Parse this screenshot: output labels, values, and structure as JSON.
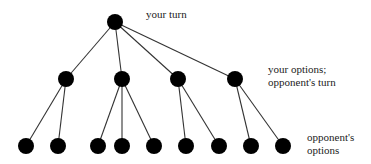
{
  "diagram": {
    "type": "game-tree",
    "colors": {
      "node": "#000000",
      "edge": "#333333",
      "text": "#222222",
      "background": "#ffffff"
    },
    "node_radius": 8,
    "nodes": [
      {
        "id": "root",
        "level": 0,
        "x": 115,
        "y": 22
      },
      {
        "id": "m1",
        "level": 1,
        "x": 66,
        "y": 79
      },
      {
        "id": "m2",
        "level": 1,
        "x": 122,
        "y": 79
      },
      {
        "id": "m3",
        "level": 1,
        "x": 178,
        "y": 79
      },
      {
        "id": "m4",
        "level": 1,
        "x": 235,
        "y": 79
      },
      {
        "id": "l1",
        "level": 2,
        "x": 26,
        "y": 146
      },
      {
        "id": "l2",
        "level": 2,
        "x": 58,
        "y": 146
      },
      {
        "id": "l3",
        "level": 2,
        "x": 98,
        "y": 146
      },
      {
        "id": "l4",
        "level": 2,
        "x": 122,
        "y": 146
      },
      {
        "id": "l5",
        "level": 2,
        "x": 154,
        "y": 146
      },
      {
        "id": "l6",
        "level": 2,
        "x": 186,
        "y": 146
      },
      {
        "id": "l7",
        "level": 2,
        "x": 219,
        "y": 146
      },
      {
        "id": "l8",
        "level": 2,
        "x": 251,
        "y": 146
      },
      {
        "id": "l9",
        "level": 2,
        "x": 283,
        "y": 146
      }
    ],
    "edges": [
      [
        "root",
        "m1"
      ],
      [
        "root",
        "m2"
      ],
      [
        "root",
        "m3"
      ],
      [
        "root",
        "m4"
      ],
      [
        "m1",
        "l1"
      ],
      [
        "m1",
        "l2"
      ],
      [
        "m2",
        "l3"
      ],
      [
        "m2",
        "l4"
      ],
      [
        "m2",
        "l5"
      ],
      [
        "m3",
        "l6"
      ],
      [
        "m3",
        "l7"
      ],
      [
        "m4",
        "l8"
      ],
      [
        "m4",
        "l9"
      ]
    ],
    "labels": {
      "level0": [
        "your turn"
      ],
      "level1": [
        "your options;",
        "opponent's turn"
      ],
      "level2": [
        "opponent's",
        "options"
      ]
    }
  }
}
